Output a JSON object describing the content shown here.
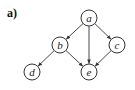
{
  "panel_label": "a)",
  "graph": {
    "type": "directed",
    "nodes": [
      {
        "id": "a",
        "label": "a",
        "x": 89,
        "y": 18
      },
      {
        "id": "b",
        "label": "b",
        "x": 60,
        "y": 45
      },
      {
        "id": "c",
        "label": "c",
        "x": 117,
        "y": 45
      },
      {
        "id": "d",
        "label": "d",
        "x": 32,
        "y": 72
      },
      {
        "id": "e",
        "label": "e",
        "x": 89,
        "y": 72
      }
    ],
    "edges": [
      {
        "from": "a",
        "to": "b"
      },
      {
        "from": "a",
        "to": "e"
      },
      {
        "from": "a",
        "to": "c"
      },
      {
        "from": "b",
        "to": "d"
      },
      {
        "from": "b",
        "to": "e"
      },
      {
        "from": "c",
        "to": "e"
      }
    ],
    "node_radius": 8,
    "stroke_color": "#333333"
  }
}
